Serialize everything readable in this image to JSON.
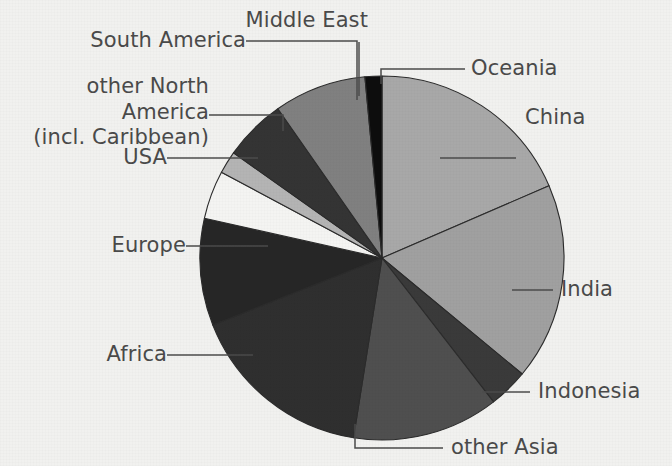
{
  "chart_data": {
    "type": "pie",
    "title": "",
    "subtitle": "",
    "xlabel": "",
    "ylabel": "",
    "legend_position": "callout-labels",
    "grid": false,
    "unit": "percent of world population",
    "center": {
      "x": 382,
      "y": 258
    },
    "radius": 182,
    "start_angle_deg": 0,
    "direction": "clockwise",
    "background_color": "#f1f1ef",
    "outline_color": "#2b2b2b",
    "label_color": "#4a4a4a",
    "categories": [
      "China",
      "India",
      "Indonesia",
      "other Asia",
      "Africa",
      "Europe",
      "USA",
      "other North America (incl. Caribbean)",
      "South America",
      "Middle East",
      "Oceania"
    ],
    "values": [
      18.5,
      17.5,
      3.5,
      13.0,
      16.5,
      9.5,
      4.3,
      2.0,
      5.5,
      8.2,
      0.6
    ],
    "colors": [
      "#a8a8a8",
      "#a0a0a0",
      "#3a3a3a",
      "#4f4f4f",
      "#2f2f2f",
      "#262626",
      "#f4f4f2",
      "#b4b4b4",
      "#343434",
      "#808080",
      "#0d0d0d"
    ],
    "slices": [
      {
        "label": "China",
        "value": 18.5,
        "color": "#a8a8a8",
        "start_deg": 0.0,
        "end_deg": 66.6
      },
      {
        "label": "India",
        "value": 17.5,
        "color": "#a0a0a0",
        "start_deg": 66.6,
        "end_deg": 129.6
      },
      {
        "label": "Indonesia",
        "value": 3.5,
        "color": "#3a3a3a",
        "start_deg": 129.6,
        "end_deg": 142.2
      },
      {
        "label": "other Asia",
        "value": 13.0,
        "color": "#4f4f4f",
        "start_deg": 142.2,
        "end_deg": 189.0
      },
      {
        "label": "Africa",
        "value": 16.5,
        "color": "#2f2f2f",
        "start_deg": 189.0,
        "end_deg": 248.4
      },
      {
        "label": "Europe",
        "value": 9.5,
        "color": "#262626",
        "start_deg": 248.4,
        "end_deg": 282.6
      },
      {
        "label": "USA",
        "value": 4.3,
        "color": "#f4f4f2",
        "start_deg": 282.6,
        "end_deg": 298.1
      },
      {
        "label": "other North America (incl. Caribbean)",
        "value": 2.0,
        "color": "#b4b4b4",
        "start_deg": 298.1,
        "end_deg": 305.3
      },
      {
        "label": "South America",
        "value": 5.5,
        "color": "#343434",
        "start_deg": 305.3,
        "end_deg": 325.1
      },
      {
        "label": "Middle East",
        "value": 8.2,
        "color": "#808080",
        "start_deg": 325.1,
        "end_deg": 354.6
      },
      {
        "label": "Oceania",
        "value": 0.6,
        "color": "#0d0d0d",
        "start_deg": 354.6,
        "end_deg": 360.0
      }
    ]
  },
  "labels": {
    "south_america": "South America",
    "other_north_america_line1": "other North America",
    "other_north_america_line2": "(incl. Caribbean)",
    "usa": "USA",
    "europe": "Europe",
    "africa": "Africa",
    "middle_east": "Middle East",
    "oceania": "Oceania",
    "china": "China",
    "india": "India",
    "indonesia": "Indonesia",
    "other_asia": "other Asia"
  }
}
